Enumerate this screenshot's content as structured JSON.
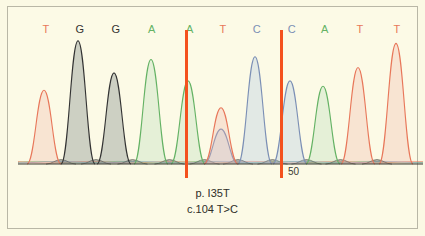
{
  "figure": {
    "background_color": "#fcfae6",
    "frame_color": "#b9b7a6",
    "marker_color": "#f4511e",
    "tick_label": "50"
  },
  "caption": {
    "protein_change": "p. I35T",
    "coding_change": "c.104 T>C"
  },
  "base_colors": {
    "A": "#64b264",
    "C": "#7b8fb5",
    "G": "#333333",
    "T": "#e8775a"
  },
  "chart_data": {
    "type": "line",
    "title": "",
    "subtitle": "",
    "xlabel": "",
    "ylabel": "",
    "grid": false,
    "legend": "none",
    "xlim": [
      0,
      405
    ],
    "ylim": [
      0,
      100
    ],
    "sequence": "TGGAATCCATT",
    "called_bases": [
      {
        "index": 1,
        "base": "T",
        "x": 26,
        "height": 55,
        "color": "#e8775a"
      },
      {
        "index": 2,
        "base": "G",
        "x": 60,
        "height": 92,
        "color": "#333333"
      },
      {
        "index": 3,
        "base": "G",
        "x": 96,
        "height": 68,
        "color": "#333333"
      },
      {
        "index": 4,
        "base": "A",
        "x": 133,
        "height": 78,
        "color": "#64b264"
      },
      {
        "index": 5,
        "base": "A",
        "x": 170,
        "height": 62,
        "color": "#64b264"
      },
      {
        "index": 6,
        "base": "T",
        "x": 203,
        "height": 42,
        "color": "#e8775a"
      },
      {
        "index": 7,
        "base": "C",
        "x": 237,
        "height": 80,
        "color": "#7b8fb5"
      },
      {
        "index": 8,
        "base": "C",
        "x": 272,
        "height": 62,
        "color": "#7b8fb5"
      },
      {
        "index": 9,
        "base": "A",
        "x": 305,
        "height": 58,
        "color": "#64b264"
      },
      {
        "index": 10,
        "base": "T",
        "x": 340,
        "height": 72,
        "color": "#e8775a"
      },
      {
        "index": 11,
        "base": "T",
        "x": 378,
        "height": 90,
        "color": "#e8775a"
      }
    ],
    "heterozygous_position": {
      "index": 6,
      "x": 203,
      "bases": [
        "T",
        "C"
      ],
      "t_height": 42,
      "c_height": 26,
      "annotation": "c.104 T>C"
    },
    "markers": [
      {
        "x": 168,
        "color": "#f4511e"
      },
      {
        "x": 263,
        "color": "#f4511e"
      }
    ],
    "baseline_y": 148,
    "annotations": [
      "p. I35T",
      "c.104 T>C",
      "50"
    ]
  },
  "base_labels": [
    {
      "base": "T",
      "x": 28
    },
    {
      "base": "G",
      "x": 62
    },
    {
      "base": "G",
      "x": 98
    },
    {
      "base": "A",
      "x": 134
    },
    {
      "base": "A",
      "x": 172
    },
    {
      "base": "T",
      "x": 205
    },
    {
      "base": "C",
      "x": 239
    },
    {
      "base": "C",
      "x": 274
    },
    {
      "base": "A",
      "x": 307
    },
    {
      "base": "T",
      "x": 342
    },
    {
      "base": "T",
      "x": 379
    }
  ]
}
